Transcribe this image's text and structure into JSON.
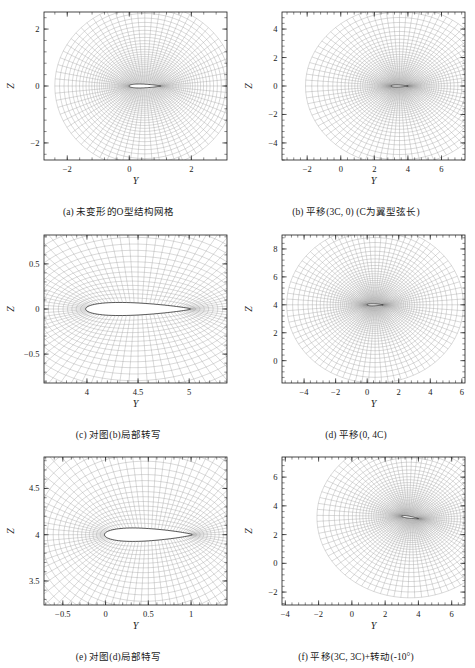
{
  "figure": {
    "title": "",
    "type": "mesh-grid-figure",
    "panel_count": 6
  },
  "panels": [
    {
      "id": "a",
      "caption": "(a) 未变形的O型结构网格",
      "xlabel": "Y",
      "ylabel": "Z",
      "xlim": [
        -2.75,
        3.15
      ],
      "ylim": [
        -2.6,
        2.6
      ],
      "xticks": [
        -2,
        0,
        2
      ],
      "yticks": [
        -2,
        0,
        2
      ],
      "xticklabels": [
        "-2",
        "0",
        "2"
      ],
      "yticklabels": [
        "-2",
        "0",
        "2"
      ],
      "mesh": {
        "type": "o-grid",
        "center_x": 0.5,
        "center_y": 0.0,
        "chord": 1.0,
        "radius": 2.9,
        "rotation_deg": 0,
        "radial_lines": 72,
        "circum_rings": 34,
        "stretch": 1.9
      }
    },
    {
      "id": "b",
      "caption": "(b) 平移(3C, 0) (C为翼型弦长)",
      "xlabel": "Y",
      "ylabel": "Z",
      "xlim": [
        -3.5,
        7.4
      ],
      "ylim": [
        -5.2,
        5.2
      ],
      "xticks": [
        -2,
        0,
        2,
        4,
        6
      ],
      "yticks": [
        -4,
        -2,
        0,
        2,
        4
      ],
      "xticklabels": [
        "-2",
        "0",
        "2",
        "4",
        "6"
      ],
      "yticklabels": [
        "-4",
        "-2",
        "0",
        "2",
        "4"
      ],
      "mesh": {
        "type": "o-grid",
        "center_x": 3.5,
        "center_y": 0.0,
        "chord": 1.0,
        "radius": 5.6,
        "rotation_deg": 0,
        "radial_lines": 84,
        "circum_rings": 38,
        "stretch": 2.4
      }
    },
    {
      "id": "c",
      "caption": "(c) 对图(b)局部转写",
      "xlabel": "Y",
      "ylabel": "Z",
      "xlim": [
        3.58,
        5.37
      ],
      "ylim": [
        -0.82,
        0.82
      ],
      "xticks": [
        4,
        4.5,
        5
      ],
      "yticks": [
        -0.5,
        0,
        0.5
      ],
      "xticklabels": [
        "4",
        "4.5",
        "5"
      ],
      "yticklabels": [
        "-0.5",
        "0",
        "0.5"
      ],
      "mesh": {
        "type": "o-grid",
        "center_x": 4.5,
        "center_y": 0.0,
        "chord": 1.0,
        "radius": 5.6,
        "rotation_deg": 0,
        "radial_lines": 84,
        "circum_rings": 38,
        "stretch": 2.4
      }
    },
    {
      "id": "d",
      "caption": "(d) 平移(0, 4C)",
      "xlabel": "Y",
      "ylabel": "Z",
      "xlim": [
        -5.4,
        6.2
      ],
      "ylim": [
        -1.6,
        9.0
      ],
      "xticks": [
        -4,
        -2,
        0,
        2,
        4,
        6
      ],
      "yticks": [
        0,
        2,
        4,
        6,
        8
      ],
      "xticklabels": [
        "-4",
        "-2",
        "0",
        "2",
        "4",
        "6"
      ],
      "yticklabels": [
        "0",
        "2",
        "4",
        "6",
        "8"
      ],
      "mesh": {
        "type": "o-grid",
        "center_x": 0.5,
        "center_y": 4.0,
        "chord": 1.0,
        "radius": 5.6,
        "rotation_deg": 0,
        "radial_lines": 84,
        "circum_rings": 38,
        "stretch": 2.4
      }
    },
    {
      "id": "e",
      "caption": "(e) 对图(d)局部特写",
      "xlabel": "Y",
      "ylabel": "Z",
      "xlim": [
        -0.72,
        1.42
      ],
      "ylim": [
        3.24,
        4.84
      ],
      "xticks": [
        -0.5,
        0,
        0.5,
        1
      ],
      "yticks": [
        3.5,
        4,
        4.5
      ],
      "xticklabels": [
        "-0.5",
        "0",
        "0.5",
        "1"
      ],
      "yticklabels": [
        "3.5",
        "4",
        "4.5"
      ],
      "mesh": {
        "type": "o-grid",
        "center_x": 0.5,
        "center_y": 4.0,
        "chord": 1.0,
        "radius": 5.6,
        "rotation_deg": 0,
        "radial_lines": 84,
        "circum_rings": 38,
        "stretch": 2.4
      }
    },
    {
      "id": "f",
      "caption": "(f) 平移(3C, 3C)+转动(-10°)",
      "xlabel": "Y",
      "ylabel": "Z",
      "xlim": [
        -4.2,
        6.8
      ],
      "ylim": [
        -2.9,
        7.4
      ],
      "xticks": [
        -4,
        -2,
        0,
        2,
        4,
        6
      ],
      "yticks": [
        -2,
        0,
        2,
        4,
        6
      ],
      "xticklabels": [
        "-4",
        "-2",
        "0",
        "2",
        "4",
        "6"
      ],
      "yticklabels": [
        "-2",
        "0",
        "2",
        "4",
        "6"
      ],
      "mesh": {
        "type": "o-grid",
        "center_x": 3.5,
        "center_y": 3.2,
        "chord": 1.0,
        "radius": 5.6,
        "rotation_deg": -10,
        "radial_lines": 84,
        "circum_rings": 38,
        "stretch": 2.4
      }
    }
  ],
  "style": {
    "mesh_color": "#8d8d8d",
    "airfoil_color": "#1a1a1a",
    "axis_color": "#1a1a1a",
    "background": "#ffffff"
  }
}
